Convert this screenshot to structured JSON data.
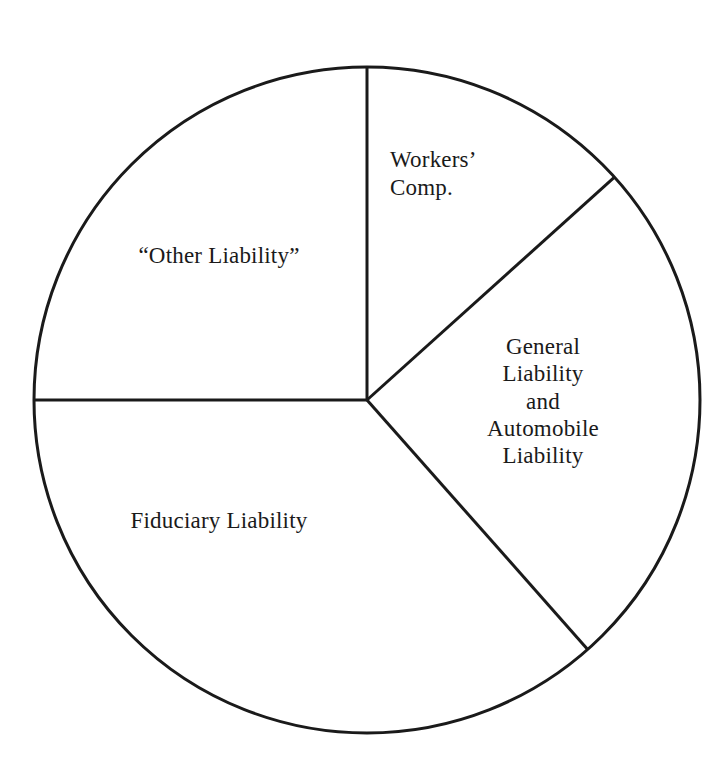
{
  "figure": {
    "name": "liability-pie-chart",
    "background_color": "#ffffff",
    "stroke_color": "#1a1a1a",
    "text_color": "#1a1a1a"
  },
  "chart_data": {
    "type": "pie",
    "title": "",
    "subtitle": "",
    "xlabel": "",
    "ylabel": "",
    "grid": false,
    "legend": "none",
    "labels_inside_slices": true,
    "geometry": {
      "center_x": 367,
      "center_y": 400,
      "radius": 333,
      "start_angle_deg": 90,
      "direction": "clockwise",
      "stroke_width": 3
    },
    "categories": [
      "Workers' Comp.",
      "General Liability and Automobile Liability",
      "Fiduciary Liability",
      "“Other Liability”"
    ],
    "values": [
      48,
      90.5,
      131.5,
      90
    ],
    "values_unit": "degrees",
    "percentages": [
      13.3,
      25.1,
      36.5,
      25.0
    ],
    "slices": [
      {
        "name": "workers-comp",
        "label_lines": [
          "Workers’",
          "Comp."
        ],
        "label_text": "Workers’\nComp.",
        "start_angle_deg": 90,
        "end_angle_deg": 42,
        "sweep_deg": 48,
        "percent": 13.3,
        "fill": "#ffffff",
        "stroke": "#1a1a1a"
      },
      {
        "name": "general-automobile-liability",
        "label_lines": [
          "General",
          "Liability",
          "and",
          "Automobile",
          "Liability"
        ],
        "label_text": "General\nLiability\nand\nAutomobile\nLiability",
        "start_angle_deg": 42,
        "end_angle_deg": -48.5,
        "sweep_deg": 90.5,
        "percent": 25.1,
        "fill": "#ffffff",
        "stroke": "#1a1a1a"
      },
      {
        "name": "fiduciary-liability",
        "label_lines": [
          "Fiduciary Liability"
        ],
        "label_text": "Fiduciary Liability",
        "start_angle_deg": -48.5,
        "end_angle_deg": -180,
        "sweep_deg": 131.5,
        "percent": 36.5,
        "fill": "#ffffff",
        "stroke": "#1a1a1a"
      },
      {
        "name": "other-liability",
        "label_lines": [
          "“Other Liability”"
        ],
        "label_text": "“Other Liability”",
        "start_angle_deg": 180,
        "end_angle_deg": 90,
        "sweep_deg": 90,
        "percent": 25.0,
        "fill": "#ffffff",
        "stroke": "#1a1a1a"
      }
    ]
  },
  "labels": {
    "other_liability": "“Other Liability”",
    "workers_comp": "Workers’\nComp.",
    "general_auto": "General\nLiability\nand\nAutomobile\nLiability",
    "fiduciary_liability": "Fiduciary Liability"
  }
}
